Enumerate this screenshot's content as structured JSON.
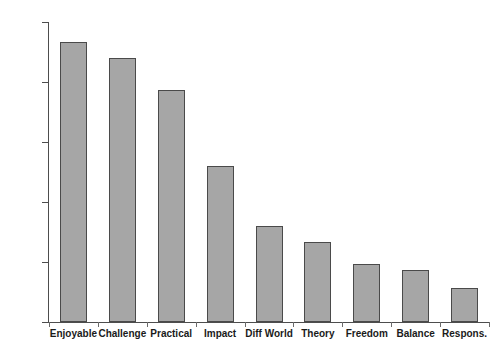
{
  "chart_data": {
    "type": "bar",
    "title": "",
    "subtitle": "",
    "xlabel": "",
    "ylabel": "",
    "categories": [
      "Enjoyable",
      "Challenge",
      "Practical",
      "Impact",
      "Diff World",
      "Theory",
      "Freedom",
      "Balance",
      "Respons."
    ],
    "values": [
      70,
      66,
      58,
      39,
      24,
      20,
      14.5,
      13,
      8.5
    ],
    "ylim": [
      0,
      75
    ],
    "yticks": [
      0,
      15,
      30,
      45,
      60,
      75
    ],
    "ytick_labels": [
      "0",
      "15",
      "30",
      "45",
      "60",
      "75"
    ],
    "grid": false,
    "legend": false,
    "legend_position": "none",
    "bar_fill_color": "#a6a6a6",
    "bar_edge_color": "#4a4a4a",
    "axis_color": "#4d4d4d",
    "text_color": "#1a1a1a",
    "background_color": "#ffffff",
    "annotations": []
  }
}
